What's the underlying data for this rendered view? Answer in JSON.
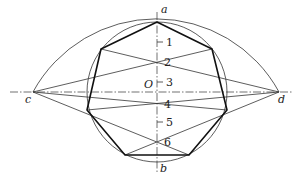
{
  "diagram": {
    "type": "geometric-construction",
    "labels": {
      "a": "a",
      "b": "b",
      "c": "c",
      "d": "d",
      "O": "O"
    },
    "division_numbers": [
      "1",
      "2",
      "3",
      "4",
      "5",
      "6"
    ],
    "colors": {
      "stroke": "#222222",
      "background": "#ffffff"
    }
  }
}
